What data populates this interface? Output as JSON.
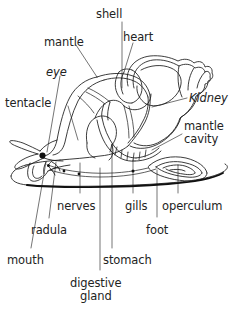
{
  "figure": {
    "style": "black line art on white",
    "line_color": "#1a1a1a",
    "text_color": "#232323",
    "background_color": "#ffffff",
    "width": 231,
    "height": 313
  },
  "labels": [
    {
      "id": "shell",
      "text": "shell",
      "x": 96,
      "y": 8,
      "align": "left",
      "italic": false
    },
    {
      "id": "mantle",
      "text": "mantle",
      "x": 44,
      "y": 36,
      "align": "left",
      "italic": false
    },
    {
      "id": "heart",
      "text": "heart",
      "x": 123,
      "y": 31,
      "align": "left",
      "italic": false
    },
    {
      "id": "eye",
      "text": "eye",
      "x": 46,
      "y": 66,
      "align": "left",
      "italic": true
    },
    {
      "id": "tentacle",
      "text": "tentacle",
      "x": 5,
      "y": 97,
      "align": "left",
      "italic": false
    },
    {
      "id": "kidney",
      "text": "Kidney",
      "x": 189,
      "y": 92,
      "align": "left",
      "italic": true
    },
    {
      "id": "mantle-cavity",
      "text": "mantle\ncavity",
      "x": 184,
      "y": 120,
      "align": "left",
      "italic": false
    },
    {
      "id": "nerves",
      "text": "nerves",
      "x": 57,
      "y": 200,
      "align": "left",
      "italic": false
    },
    {
      "id": "gills",
      "text": "gills",
      "x": 125,
      "y": 200,
      "align": "left",
      "italic": false
    },
    {
      "id": "operculum",
      "text": "operculum",
      "x": 162,
      "y": 200,
      "align": "left",
      "italic": false
    },
    {
      "id": "radula",
      "text": "radula",
      "x": 31,
      "y": 224,
      "align": "left",
      "italic": false
    },
    {
      "id": "foot",
      "text": "foot",
      "x": 146,
      "y": 224,
      "align": "left",
      "italic": false
    },
    {
      "id": "mouth",
      "text": "mouth",
      "x": 7,
      "y": 254,
      "align": "left",
      "italic": false
    },
    {
      "id": "stomach",
      "text": "stomach",
      "x": 103,
      "y": 254,
      "align": "left",
      "italic": false
    },
    {
      "id": "digestive-gland",
      "text": "digestive\ngland",
      "x": 70,
      "y": 277,
      "align": "left",
      "italic": false
    }
  ],
  "parts": [
    "shell",
    "mantle",
    "heart",
    "eye",
    "tentacle",
    "kidney",
    "mantle cavity",
    "nerves",
    "gills",
    "operculum",
    "radula",
    "foot",
    "mouth",
    "stomach",
    "digestive gland"
  ]
}
